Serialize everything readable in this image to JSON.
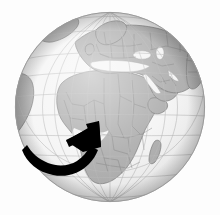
{
  "figure": {
    "kind": "orthographic-globe-illustration",
    "title": "Globe centered on Africa with curved arrow",
    "width": 220,
    "height": 215,
    "background_color": "#fdfdfd"
  },
  "globe": {
    "name": "earth-globe",
    "projection": "orthographic",
    "center_x": 110,
    "center_y": 107,
    "radius": 95,
    "ocean_color": "#f4f4f4",
    "land_color": "#a9a9a9",
    "land_border_color": "#6e6e6e",
    "outline_color": "#9a9a9a",
    "shading": "subtle-sphere-shading",
    "center_lon": 18,
    "center_lat": 12
  },
  "graticule": {
    "name": "lat-lon-grid",
    "color": "#b4b4b4",
    "stroke_width": 0.6,
    "meridian_step_deg": 15,
    "parallel_step_deg": 15,
    "equator_emphasis": false
  },
  "landmasses": [
    {
      "name": "africa",
      "label": "Africa",
      "prominent": true
    },
    {
      "name": "europe",
      "label": "Europe",
      "prominent": true
    },
    {
      "name": "asia-west",
      "label": "Western Asia",
      "prominent": true
    },
    {
      "name": "arabian-peninsula",
      "label": "Arabian Peninsula",
      "prominent": true
    },
    {
      "name": "madagascar",
      "label": "Madagascar",
      "prominent": false
    },
    {
      "name": "south-america-edge",
      "label": "South America (limb)",
      "prominent": false
    },
    {
      "name": "greenland-edge",
      "label": "Greenland (limb)",
      "prominent": false
    }
  ],
  "arrow": {
    "name": "curved-pointer-arrow",
    "color": "#000000",
    "description": "Thick black crescent swoosh sweeping from lower-left up to an arrowhead aimed at West Africa",
    "direction": "up-right",
    "tail_point": [
      22,
      150
    ],
    "tip_point": [
      99,
      121
    ]
  },
  "colors": {
    "black": "#000000",
    "land": "#a9a9a9",
    "ocean": "#f4f4f4",
    "grid": "#b4b4b4",
    "background": "#fdfdfd"
  }
}
